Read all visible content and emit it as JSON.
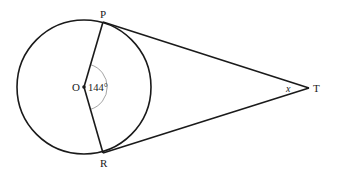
{
  "diagram": {
    "type": "circle-tangents",
    "colors": {
      "stroke": "#1a1a1a",
      "arc_marker": "#9a9a9a",
      "background": "#ffffff"
    },
    "points": {
      "O": {
        "label": "O",
        "description": "center of circle"
      },
      "P": {
        "label": "P",
        "description": "point of tangency (upper)"
      },
      "R": {
        "label": "R",
        "description": "point of tangency (lower)"
      },
      "T": {
        "label": "T",
        "description": "external point"
      }
    },
    "segments": [
      "OP",
      "OR",
      "PT",
      "RT"
    ],
    "angles": {
      "POR": {
        "label": "144°",
        "value": 144
      },
      "PTR": {
        "label": "x"
      }
    }
  }
}
